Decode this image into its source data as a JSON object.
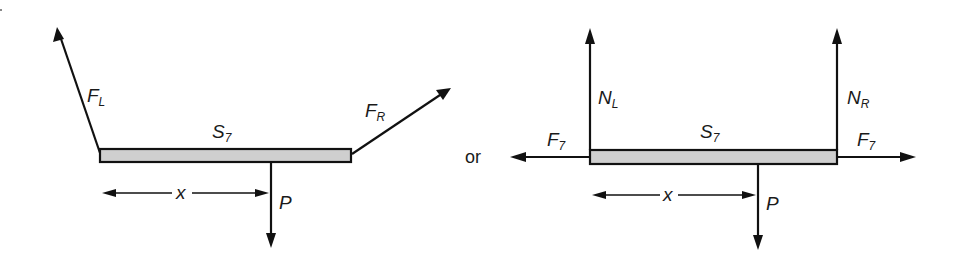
{
  "figure": {
    "separator_label": "or",
    "left_diagram": {
      "member_label": "S",
      "member_sub": "7",
      "forces": {
        "left": {
          "label": "F",
          "sub": "L",
          "direction": "up-left"
        },
        "right": {
          "label": "F",
          "sub": "R",
          "direction": "up-right"
        },
        "load": {
          "label": "P",
          "sub": "",
          "direction": "down"
        }
      },
      "dimension": {
        "label": "x"
      }
    },
    "right_diagram": {
      "member_label": "S",
      "member_sub": "7",
      "forces": {
        "normal_left": {
          "label": "N",
          "sub": "L",
          "direction": "up"
        },
        "normal_right": {
          "label": "N",
          "sub": "R",
          "direction": "up"
        },
        "axial_left": {
          "label": "F",
          "sub": "7",
          "direction": "left"
        },
        "axial_right": {
          "label": "F",
          "sub": "7",
          "direction": "right"
        },
        "load": {
          "label": "P",
          "sub": "",
          "direction": "down"
        }
      },
      "dimension": {
        "label": "x"
      }
    },
    "colors": {
      "line": "#111111",
      "bar_fill": "#cfcfcf",
      "background": "#ffffff"
    }
  }
}
